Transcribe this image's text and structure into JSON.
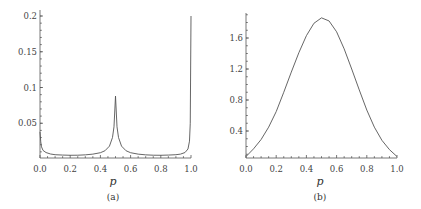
{
  "chart_data": [
    {
      "type": "line",
      "caption": "(a)",
      "xlabel": "p",
      "ylabel": "",
      "xlim": [
        0.0,
        1.0
      ],
      "ylim": [
        0.0,
        0.2
      ],
      "x_ticks": [
        "0.0",
        "0.2",
        "0.4",
        "0.6",
        "0.8",
        "1.0"
      ],
      "y_ticks": [
        "0.05",
        "0.1",
        "0.15",
        "0.2"
      ],
      "grid": false,
      "x": [
        0.0,
        0.005,
        0.01,
        0.02,
        0.04,
        0.07,
        0.1,
        0.15,
        0.2,
        0.25,
        0.3,
        0.35,
        0.4,
        0.43,
        0.46,
        0.48,
        0.49,
        0.5,
        0.51,
        0.52,
        0.54,
        0.57,
        0.6,
        0.65,
        0.7,
        0.75,
        0.8,
        0.85,
        0.9,
        0.93,
        0.96,
        0.98,
        0.99,
        0.995,
        1.0
      ],
      "values": [
        0.038,
        0.024,
        0.017,
        0.012,
        0.009,
        0.007,
        0.006,
        0.0055,
        0.0052,
        0.0053,
        0.0058,
        0.0068,
        0.0088,
        0.0115,
        0.018,
        0.03,
        0.045,
        0.088,
        0.045,
        0.03,
        0.018,
        0.0115,
        0.0088,
        0.0068,
        0.0058,
        0.0053,
        0.0052,
        0.0055,
        0.006,
        0.0068,
        0.009,
        0.014,
        0.025,
        0.05,
        0.2
      ]
    },
    {
      "type": "line",
      "caption": "(b)",
      "xlabel": "p",
      "ylabel": "",
      "xlim": [
        0.0,
        1.0
      ],
      "ylim": [
        0.0,
        1.9
      ],
      "x_ticks": [
        "0.0",
        "0.2",
        "0.4",
        "0.6",
        "0.8",
        "1.0"
      ],
      "y_ticks": [
        "0.4",
        "0.8",
        "1.2",
        "1.6"
      ],
      "grid": false,
      "x": [
        0.0,
        0.05,
        0.1,
        0.15,
        0.2,
        0.25,
        0.3,
        0.35,
        0.4,
        0.45,
        0.5,
        0.55,
        0.6,
        0.65,
        0.7,
        0.75,
        0.8,
        0.85,
        0.9,
        0.95,
        1.0
      ],
      "values": [
        0.07,
        0.17,
        0.29,
        0.45,
        0.65,
        0.9,
        1.16,
        1.41,
        1.63,
        1.79,
        1.86,
        1.82,
        1.68,
        1.46,
        1.2,
        0.93,
        0.67,
        0.45,
        0.28,
        0.16,
        0.07
      ]
    }
  ]
}
